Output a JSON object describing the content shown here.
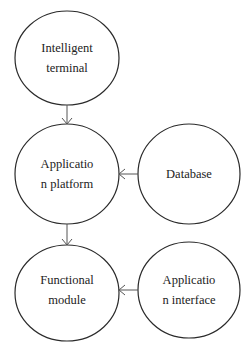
{
  "diagram": {
    "type": "flow",
    "colors": {
      "stroke": "#2a2a2a",
      "arrow": "#555555",
      "text": "#222222",
      "background": "#ffffff"
    },
    "nodes": [
      {
        "id": "intelligent-terminal",
        "lines": [
          "Intelligent",
          "terminal"
        ]
      },
      {
        "id": "application-platform",
        "lines": [
          "Applicatio",
          "n platform"
        ]
      },
      {
        "id": "database",
        "lines": [
          "Database"
        ]
      },
      {
        "id": "functional-module",
        "lines": [
          "Functional",
          "module"
        ]
      },
      {
        "id": "application-interface",
        "lines": [
          "Applicatio",
          "n interface"
        ]
      }
    ],
    "edges": [
      {
        "from": "intelligent-terminal",
        "to": "application-platform"
      },
      {
        "from": "database",
        "to": "application-platform"
      },
      {
        "from": "application-platform",
        "to": "functional-module"
      },
      {
        "from": "application-interface",
        "to": "functional-module"
      }
    ]
  }
}
